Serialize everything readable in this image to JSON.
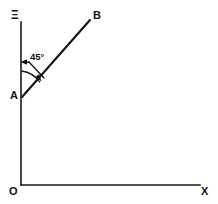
{
  "figure": {
    "background_color": "#ffffff",
    "ink_color": "#141414",
    "labels": {
      "y_axis": "Ξ",
      "x_axis": "X",
      "origin": "O",
      "point_a": "A",
      "point_b": "B",
      "angle": "45°"
    },
    "geometry": {
      "origin": [
        21,
        185
      ],
      "y_axis_top": [
        21,
        22
      ],
      "x_axis_right": [
        200,
        185
      ],
      "point_a": [
        22,
        97
      ],
      "point_b": [
        90,
        20
      ],
      "angle_degrees": 45,
      "angle_measured_from": "vertical axis",
      "arc_radius": 26
    }
  }
}
